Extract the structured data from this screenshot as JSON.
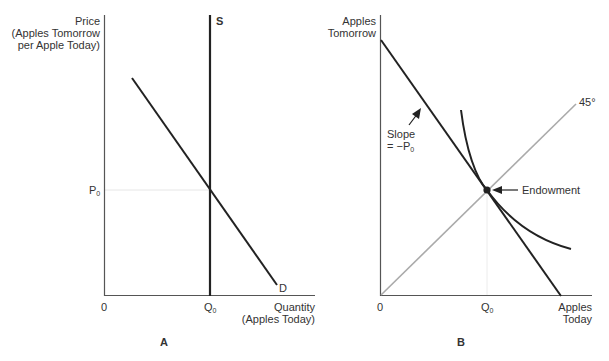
{
  "panel_a": {
    "panel_label": "A",
    "y_axis_label_line1": "Price",
    "y_axis_label_line2": "(Apples Tomorrow",
    "y_axis_label_line3": "per Apple Today)",
    "x_axis_label_line1": "Quantity",
    "x_axis_label_line2": "(Apples Today)",
    "origin_label": "0",
    "supply_label": "S",
    "demand_label": "D",
    "price_tick_main": "P",
    "price_tick_sub": "0",
    "quantity_tick_main": "Q",
    "quantity_tick_sub": "0"
  },
  "panel_b": {
    "panel_label": "B",
    "y_axis_label_line1": "Apples",
    "y_axis_label_line2": "Tomorrow",
    "x_axis_label_line1": "Apples",
    "x_axis_label_line2": "Today",
    "origin_label": "0",
    "quantity_tick_main": "Q",
    "quantity_tick_sub": "0",
    "diagonal_label": "45°",
    "slope_label_line1": "Slope",
    "slope_label_line2": "= −P",
    "slope_label_sub": "0",
    "endowment_label": "Endowment"
  },
  "colors": {
    "line": "#222222",
    "axis": "#555555",
    "diagonal": "#aaaaaa",
    "guide": "#e6e6e6"
  }
}
